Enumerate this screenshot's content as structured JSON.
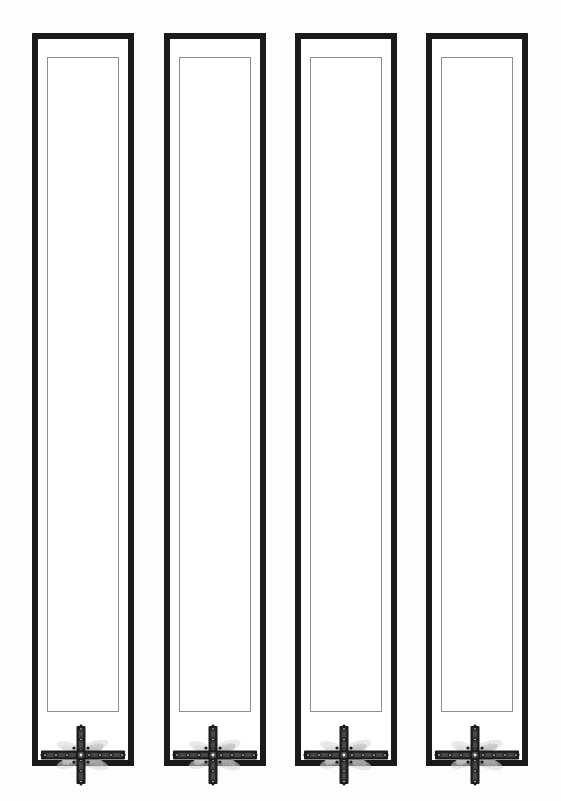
{
  "document": {
    "title": "Decorative Bookmark Panel Sheet",
    "background_color": "#fdfdfd",
    "page_width": 561,
    "page_height": 801,
    "panel_count": 4
  },
  "style": {
    "outer_border_color": "#1a1a1a",
    "outer_border_width": 6,
    "inner_frame_color": "#8d8d8d",
    "inner_frame_width": 1,
    "panel_fill_color": "#ffffff",
    "ornament_dark_color": "#1c1c1c",
    "ornament_mid_color": "#4a4a4a",
    "ornament_wing_color": "#b7b7b7",
    "ornament_wing_color_light": "#d8d8d8"
  },
  "panels": [
    {
      "id": "panel-1",
      "label": "Bookmark Panel 1",
      "x": 32,
      "y": 33,
      "width": 102,
      "height": 733,
      "inner": {
        "x": 15,
        "y": 24,
        "width": 72,
        "height": 655
      },
      "ornament": {
        "name": "jeweled-cross-ornament",
        "x": 6,
        "y": 690,
        "width": 90,
        "height": 64
      }
    },
    {
      "id": "panel-2",
      "label": "Bookmark Panel 2",
      "x": 164,
      "y": 33,
      "width": 102,
      "height": 733,
      "inner": {
        "x": 15,
        "y": 24,
        "width": 72,
        "height": 655
      },
      "ornament": {
        "name": "jeweled-cross-ornament",
        "x": 6,
        "y": 690,
        "width": 90,
        "height": 64
      }
    },
    {
      "id": "panel-3",
      "label": "Bookmark Panel 3",
      "x": 295,
      "y": 33,
      "width": 102,
      "height": 733,
      "inner": {
        "x": 15,
        "y": 24,
        "width": 72,
        "height": 655
      },
      "ornament": {
        "name": "jeweled-cross-ornament",
        "x": 6,
        "y": 690,
        "width": 90,
        "height": 64
      }
    },
    {
      "id": "panel-4",
      "label": "Bookmark Panel 4",
      "x": 426,
      "y": 33,
      "width": 102,
      "height": 733,
      "inner": {
        "x": 15,
        "y": 24,
        "width": 72,
        "height": 655
      },
      "ornament": {
        "name": "jeweled-cross-ornament",
        "x": 6,
        "y": 690,
        "width": 90,
        "height": 64
      }
    }
  ]
}
